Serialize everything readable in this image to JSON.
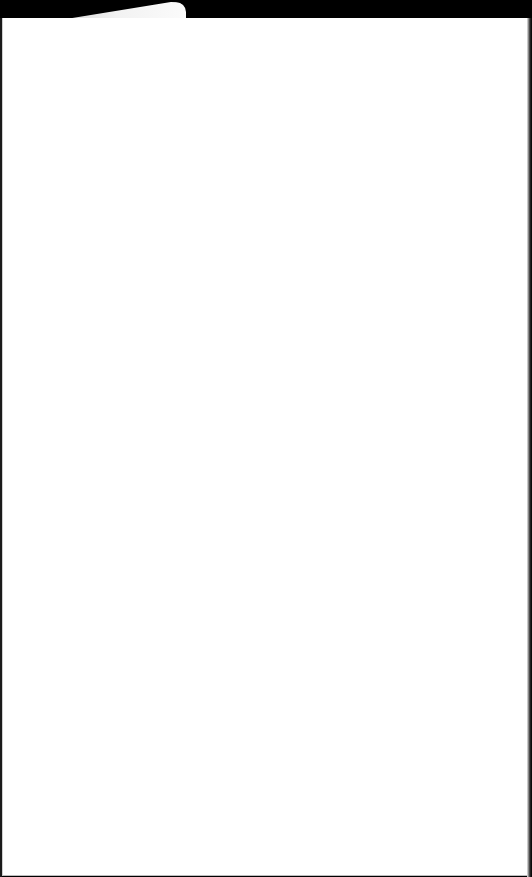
{
  "scene": {
    "description": "Blank white sheet of paper with a folded/torn tab at the top against a black background",
    "colors": {
      "background": "#000000",
      "paper": "#ffffff",
      "tab": "#f2f2f2"
    }
  },
  "page": {
    "text": ""
  }
}
